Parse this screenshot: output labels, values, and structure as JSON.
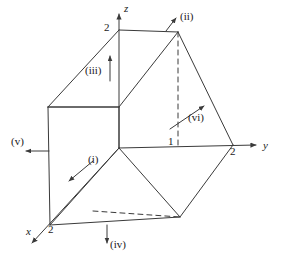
{
  "figure": {
    "background_color": "#ffffff",
    "line_color": "#3a3a3a",
    "text_color": "#1a1a1a",
    "width": 281,
    "height": 264
  },
  "axes": [
    {
      "key": "x",
      "label": "x",
      "label_x": 26,
      "label_y": 226
    },
    {
      "key": "y",
      "label": "y",
      "label_x": 263,
      "label_y": 140
    },
    {
      "key": "z",
      "label": "z",
      "label_x": 124,
      "label_y": 3
    }
  ],
  "ticks": [
    {
      "key": "z2",
      "label": "2",
      "axis": "z",
      "value": 2,
      "label_x": 104,
      "label_y": 22
    },
    {
      "key": "y2",
      "label": "2",
      "axis": "y",
      "value": 2,
      "label_x": 230,
      "label_y": 146
    },
    {
      "key": "y1",
      "label": "1",
      "axis": "y",
      "value": 1,
      "label_x": 168,
      "label_y": 136
    },
    {
      "key": "x2",
      "label": "2",
      "axis": "x",
      "value": 2,
      "label_x": 48,
      "label_y": 224
    }
  ],
  "face_labels": [
    {
      "key": "i",
      "label": "(i)",
      "label_x": 88,
      "label_y": 154
    },
    {
      "key": "ii",
      "label": "(ii)",
      "label_x": 180,
      "label_y": 11
    },
    {
      "key": "iii",
      "label": "(iii)",
      "label_x": 85,
      "label_y": 65
    },
    {
      "key": "iv",
      "label": "(iv)",
      "label_x": 110,
      "label_y": 239
    },
    {
      "key": "v",
      "label": "(v)",
      "label_x": 11,
      "label_y": 136
    },
    {
      "key": "vi",
      "label": "(vi)",
      "label_x": 188,
      "label_y": 112
    }
  ],
  "geometry": {
    "origin": [
      119,
      148
    ],
    "vertices": {
      "origin": [
        119,
        148
      ],
      "z_top": [
        119,
        30
      ],
      "y_two": [
        234,
        145
      ],
      "x_two": [
        50,
        225
      ],
      "left_upper": [
        48,
        107
      ],
      "top_front": [
        178,
        32
      ],
      "right_lower": [
        232,
        146
      ],
      "bottom_mid": [
        180,
        217
      ],
      "bottom_left": [
        50,
        225
      ],
      "bottom_front": [
        108,
        225
      ]
    }
  },
  "normals": [
    {
      "key": "i",
      "from": [
        93,
        161
      ],
      "to": [
        68,
        182
      ]
    },
    {
      "key": "ii",
      "from": [
        166,
        31
      ],
      "to": [
        177,
        17
      ]
    },
    {
      "key": "iii",
      "from": [
        110,
        81
      ],
      "to": [
        110,
        55
      ]
    },
    {
      "key": "iv",
      "from": [
        107,
        225
      ],
      "to": [
        107,
        244
      ]
    },
    {
      "key": "v",
      "from": [
        49,
        151
      ],
      "to": [
        25,
        151
      ]
    },
    {
      "key": "vi",
      "from": [
        170,
        129
      ],
      "to": [
        205,
        105
      ]
    }
  ]
}
